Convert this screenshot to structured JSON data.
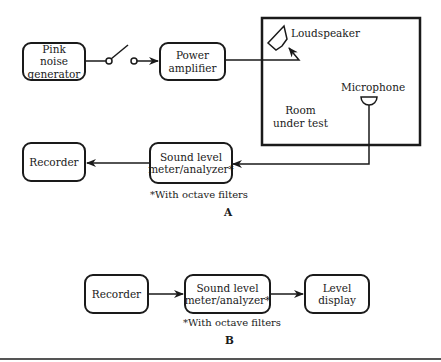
{
  "diagram_a": {
    "panel_label": "A",
    "boxes": {
      "pink_noise": "Pink\nnoise\ngenerator",
      "power_amp": "Power\namplifier",
      "recorder": "Recorder",
      "sound_level_meter": "Sound level\nmeter/analyzer*"
    },
    "room_label": "Room\nunder test",
    "loudspeaker_label": "Loudspeaker",
    "microphone_label": "Microphone",
    "footnote": "*With octave filters"
  },
  "diagram_b": {
    "panel_label": "B",
    "boxes": {
      "recorder": "Recorder",
      "sound_level_meter": "Sound level\nmeter/analyzer*",
      "level_display": "Level\ndisplay"
    },
    "footnote": "*With octave filters"
  },
  "colors": {
    "stroke": "#1a1a1a",
    "background": "#ffffff"
  }
}
